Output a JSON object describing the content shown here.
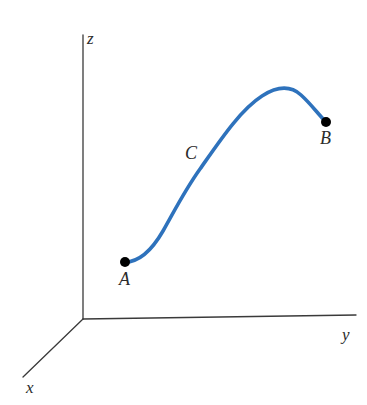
{
  "figure": {
    "kind": "3d-coordinate-curve-diagram",
    "width": 367,
    "height": 405,
    "background_color": "#ffffff"
  },
  "axes": {
    "origin": {
      "x": 83,
      "y": 319
    },
    "line_color": "#3a3a3a",
    "line_width": 1.3,
    "items": [
      {
        "name": "z-axis",
        "label": "z",
        "from": {
          "x": 83,
          "y": 319
        },
        "to": {
          "x": 83,
          "y": 35
        }
      },
      {
        "name": "y-axis",
        "label": "y",
        "from": {
          "x": 83,
          "y": 319
        },
        "to": {
          "x": 356,
          "y": 315
        }
      },
      {
        "name": "x-axis",
        "label": "x",
        "from": {
          "x": 83,
          "y": 319
        },
        "to": {
          "x": 23,
          "y": 377
        }
      }
    ]
  },
  "curve": {
    "label": "C",
    "color": "#2e72bc",
    "stroke_width": 3.6,
    "path": "M 125 262 C 140 262 152 250 163 231 C 176 208 185 190 200 169 C 219 142 240 110 262 96 C 276 87 290 85 301 95 C 311 104 318 114 326 122",
    "label_position": {
      "x": 193,
      "y": 155
    }
  },
  "points": [
    {
      "name": "point-a",
      "label": "A",
      "x": 125,
      "y": 262,
      "radius": 5,
      "color": "#000000",
      "label_position": {
        "x": 127,
        "y": 281
      }
    },
    {
      "name": "point-b",
      "label": "B",
      "x": 326,
      "y": 122,
      "radius": 5,
      "color": "#000000",
      "label_position": {
        "x": 328,
        "y": 141
      }
    }
  ],
  "chart_data": {
    "type": "line",
    "title": "",
    "xlabel": "y",
    "ylabel": "z",
    "zlabel": "x",
    "grid": false,
    "legend": null,
    "annotations": [
      {
        "text": "A",
        "role": "start-point-label"
      },
      {
        "text": "B",
        "role": "end-point-label"
      },
      {
        "text": "C",
        "role": "curve-name-label"
      },
      {
        "text": "x",
        "role": "axis-label"
      },
      {
        "text": "y",
        "role": "axis-label"
      },
      {
        "text": "z",
        "role": "axis-label"
      }
    ],
    "series": [
      {
        "name": "C",
        "color": "#2e72bc",
        "points": [
          {
            "x": 125,
            "y": 262
          },
          {
            "x": 140,
            "y": 260
          },
          {
            "x": 155,
            "y": 244
          },
          {
            "x": 170,
            "y": 222
          },
          {
            "x": 185,
            "y": 197
          },
          {
            "x": 200,
            "y": 169
          },
          {
            "x": 220,
            "y": 140
          },
          {
            "x": 240,
            "y": 115
          },
          {
            "x": 260,
            "y": 97
          },
          {
            "x": 275,
            "y": 90
          },
          {
            "x": 288,
            "y": 89
          },
          {
            "x": 300,
            "y": 95
          },
          {
            "x": 313,
            "y": 107
          },
          {
            "x": 326,
            "y": 122
          }
        ]
      }
    ]
  }
}
